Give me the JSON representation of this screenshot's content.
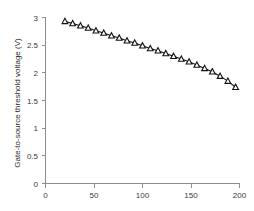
{
  "chart_data": {
    "type": "line",
    "title": "",
    "xlabel": "",
    "ylabel": "Gate-to-source  threshold  voltage  (V)",
    "xlim": [
      0,
      200
    ],
    "ylim": [
      0,
      3
    ],
    "xticks": [
      0,
      50,
      100,
      150,
      200
    ],
    "yticks": [
      0,
      0.5,
      1,
      1.5,
      2,
      2.5,
      3
    ],
    "xtick_labels": [
      "0",
      "50",
      "100",
      "150",
      "200"
    ],
    "ytick_labels": [
      "0",
      "0.5",
      "1",
      "1.5",
      "2",
      "2.5",
      "3"
    ],
    "grid": false,
    "legend": null,
    "marker": "triangle-up-open",
    "line_color": "#111111",
    "marker_face_color": "#ffffff",
    "marker_edge_color": "#111111",
    "axis_color": "#8d8d8d",
    "series": [
      {
        "name": "Gate-to-source threshold voltage",
        "x": [
          20,
          28,
          36,
          44,
          52,
          60,
          68,
          76,
          84,
          92,
          100,
          108,
          116,
          124,
          132,
          140,
          148,
          156,
          164,
          172,
          180,
          188,
          196
        ],
        "y": [
          2.93,
          2.89,
          2.85,
          2.81,
          2.76,
          2.72,
          2.67,
          2.63,
          2.58,
          2.54,
          2.49,
          2.44,
          2.4,
          2.35,
          2.3,
          2.25,
          2.2,
          2.14,
          2.08,
          2.02,
          1.94,
          1.85,
          1.74
        ]
      }
    ]
  }
}
